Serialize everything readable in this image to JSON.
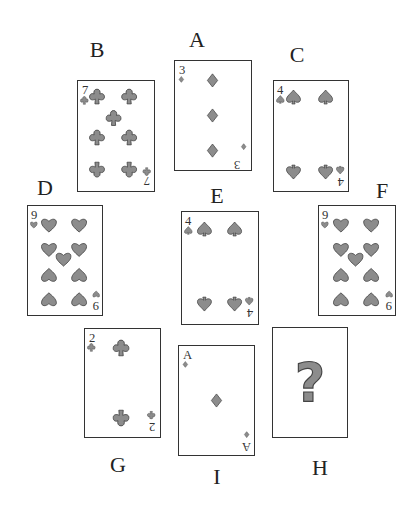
{
  "puzzle": {
    "description": "Arrangement of playing cards labeled A–I with one unknown card (H)",
    "cards": [
      {
        "label": "A",
        "rank": "3",
        "suit": "diamonds",
        "pips": 3
      },
      {
        "label": "B",
        "rank": "7",
        "suit": "clubs",
        "pips": 7
      },
      {
        "label": "C",
        "rank": "4",
        "suit": "spades",
        "pips": 4
      },
      {
        "label": "D",
        "rank": "9",
        "suit": "hearts",
        "pips": 9
      },
      {
        "label": "E",
        "rank": "4",
        "suit": "spades",
        "pips": 4
      },
      {
        "label": "F",
        "rank": "9",
        "suit": "hearts",
        "pips": 9
      },
      {
        "label": "G",
        "rank": "2",
        "suit": "clubs",
        "pips": 2
      },
      {
        "label": "I",
        "rank": "A",
        "suit": "diamonds",
        "pips": 1
      },
      {
        "label": "H",
        "rank": "?",
        "suit": "unknown",
        "pips": 0
      }
    ],
    "unknown_symbol": "?"
  },
  "labels": {
    "A": "A",
    "B": "B",
    "C": "C",
    "D": "D",
    "E": "E",
    "F": "F",
    "G": "G",
    "H": "H",
    "I": "I"
  },
  "ranks": {
    "A": "3",
    "B": "7",
    "C": "4",
    "D": "9",
    "E": "4",
    "F": "9",
    "G": "2",
    "I": "A",
    "H": "?"
  },
  "colors": {
    "pip_fill": "#8c8c8c",
    "outline": "#333333",
    "background": "#ffffff"
  }
}
